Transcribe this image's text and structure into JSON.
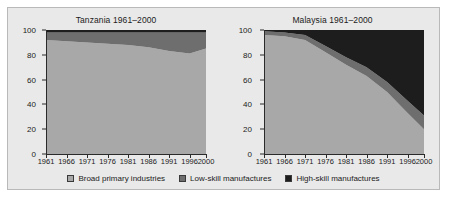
{
  "figure": {
    "background_color": "#e9e9e9",
    "border_color": "#b9b9b9"
  },
  "legend": {
    "position": "bottom-center",
    "items": [
      {
        "label": "Broad primary industries",
        "color": "#a8a8a8"
      },
      {
        "label": "Low-skill manufactures",
        "color": "#6e6e6e"
      },
      {
        "label": "High-skill manufactures",
        "color": "#1d1d1d"
      }
    ]
  },
  "axis": {
    "y_ticks": [
      0,
      20,
      40,
      60,
      80,
      100
    ],
    "x_ticks": [
      1961,
      1966,
      1971,
      1976,
      1981,
      1986,
      1991,
      1996,
      2000
    ]
  },
  "chart_data": [
    {
      "type": "area",
      "stacked": true,
      "title": "Tanzania 1961–2000",
      "xlabel": "",
      "ylabel": "",
      "ylim": [
        0,
        100
      ],
      "xlim": [
        1961,
        2000
      ],
      "grid": false,
      "x": [
        1961,
        1966,
        1971,
        1976,
        1981,
        1986,
        1991,
        1996,
        2000
      ],
      "series": [
        {
          "name": "Broad primary industries",
          "color": "#a8a8a8",
          "values": [
            92,
            91,
            90,
            89,
            88,
            86,
            83,
            81,
            85
          ]
        },
        {
          "name": "Low-skill manufactures",
          "color": "#6e6e6e",
          "values": [
            6,
            7,
            8,
            9,
            10,
            12,
            15,
            17,
            13
          ]
        },
        {
          "name": "High-skill manufactures",
          "color": "#1d1d1d",
          "values": [
            2,
            2,
            2,
            2,
            2,
            2,
            2,
            2,
            2
          ]
        }
      ]
    },
    {
      "type": "area",
      "stacked": true,
      "title": "Malaysia 1961–2000",
      "xlabel": "",
      "ylabel": "",
      "ylim": [
        0,
        100
      ],
      "xlim": [
        1961,
        2000
      ],
      "grid": false,
      "x": [
        1961,
        1966,
        1971,
        1976,
        1981,
        1986,
        1991,
        1996,
        2000
      ],
      "series": [
        {
          "name": "Broad primary industries",
          "color": "#a8a8a8",
          "values": [
            96,
            95,
            92,
            82,
            72,
            63,
            50,
            33,
            20
          ]
        },
        {
          "name": "Low-skill manufactures",
          "color": "#6e6e6e",
          "values": [
            3,
            3,
            4,
            5,
            6,
            7,
            8,
            10,
            11
          ]
        },
        {
          "name": "High-skill manufactures",
          "color": "#1d1d1d",
          "values": [
            1,
            2,
            4,
            13,
            22,
            30,
            42,
            57,
            69
          ]
        }
      ]
    }
  ]
}
